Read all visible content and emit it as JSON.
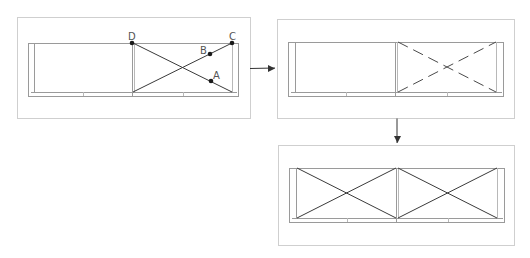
{
  "colors": {
    "panel_border": "#cfcfcf",
    "frame_line": "#9a9a9a",
    "frame_inner": "#b8b8b8",
    "brace_line": "#3a3a3a",
    "dashed_line": "#4a4a4a",
    "point_fill": "#1a1a1a",
    "label_color": "#555555",
    "arrow_color": "#333333"
  },
  "panels": [
    {
      "id": "panel-initial",
      "box": {
        "x": 17,
        "y": 17,
        "w": 233,
        "h": 101
      },
      "frame": {
        "x": 28,
        "y": 43,
        "w": 210,
        "h": 53,
        "post_inner_offset": 6,
        "rail_y": 92,
        "posts_x": [
          133
        ],
        "rail_ticks": [
          83,
          183
        ]
      },
      "bays": [
        {
          "x1": 133,
          "x2": 232,
          "style": "solid",
          "brace": true
        }
      ],
      "points": [
        {
          "label": "D",
          "x": 132,
          "y": 43,
          "lx": 128,
          "ly": 40
        },
        {
          "label": "C",
          "x": 232,
          "y": 43,
          "lx": 229,
          "ly": 40
        },
        {
          "label": "B",
          "x": 210,
          "y": 54,
          "lx": 200,
          "ly": 54
        },
        {
          "label": "A",
          "x": 211,
          "y": 81,
          "lx": 213,
          "ly": 79
        }
      ]
    },
    {
      "id": "panel-dashed",
      "box": {
        "x": 277,
        "y": 19,
        "w": 237,
        "h": 99
      },
      "frame": {
        "x": 288,
        "y": 42,
        "w": 215,
        "h": 54,
        "post_inner_offset": 7,
        "rail_y": 92,
        "posts_x": [
          396
        ],
        "rail_ticks": [
          346,
          447
        ]
      },
      "bays": [
        {
          "x1": 398,
          "x2": 496,
          "style": "dashed",
          "brace": true
        }
      ],
      "points": []
    },
    {
      "id": "panel-final",
      "box": {
        "x": 278,
        "y": 145,
        "w": 236,
        "h": 100
      },
      "frame": {
        "x": 289,
        "y": 168,
        "w": 215,
        "h": 54,
        "post_inner_offset": 7,
        "rail_y": 218,
        "posts_x": [
          397
        ],
        "rail_ticks": [
          347,
          448
        ]
      },
      "bays": [
        {
          "x1": 297,
          "x2": 396,
          "style": "solid",
          "brace": true
        },
        {
          "x1": 398,
          "x2": 497,
          "style": "solid",
          "brace": true
        }
      ],
      "points": []
    }
  ],
  "arrows": [
    {
      "id": "arrow-right",
      "x1": 250,
      "y1": 68,
      "x2": 275,
      "y2": 68,
      "direction": "right"
    },
    {
      "id": "arrow-down",
      "x1": 397,
      "y1": 118,
      "x2": 397,
      "y2": 143,
      "direction": "down"
    }
  ]
}
